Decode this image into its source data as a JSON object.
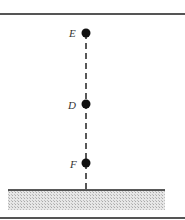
{
  "diagram": {
    "points": [
      {
        "label": "E",
        "x": 86,
        "y": 33
      },
      {
        "label": "D",
        "x": 86,
        "y": 104
      },
      {
        "label": "F",
        "x": 86,
        "y": 163
      }
    ],
    "ground_y": 190,
    "colors": {
      "dot": "#111111",
      "line": "#222222",
      "ground": "#cfcfcf",
      "frame": "#555555"
    }
  }
}
